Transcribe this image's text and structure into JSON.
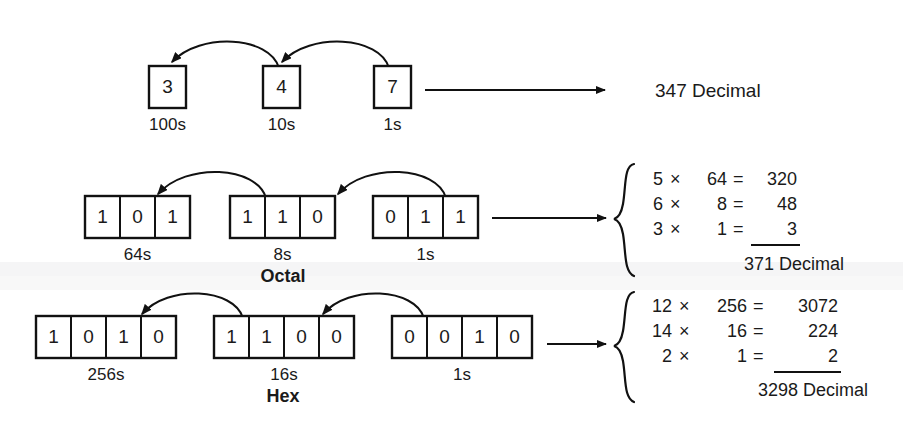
{
  "figure": {
    "background_color": "#ffffff",
    "ink_color": "#111111"
  },
  "rows": [
    {
      "id": "decimal",
      "base_label": "",
      "groups": [
        {
          "digits": [
            "3"
          ],
          "place_label": "100s"
        },
        {
          "digits": [
            "4"
          ],
          "place_label": "10s"
        },
        {
          "digits": [
            "7"
          ],
          "place_label": "1s"
        }
      ],
      "result": "347 Decimal"
    },
    {
      "id": "octal",
      "base_label": "Octal",
      "groups": [
        {
          "digits": [
            "1",
            "0",
            "1"
          ],
          "place_label": "64s"
        },
        {
          "digits": [
            "1",
            "1",
            "0"
          ],
          "place_label": "8s"
        },
        {
          "digits": [
            "0",
            "1",
            "1"
          ],
          "place_label": "1s"
        }
      ],
      "calc": {
        "lines": [
          {
            "digit": "5",
            "times": "×",
            "weight": "64",
            "equals": "=",
            "product": "320"
          },
          {
            "digit": "6",
            "times": "×",
            "weight": "8",
            "equals": "=",
            "product": "48"
          },
          {
            "digit": "3",
            "times": "×",
            "weight": "1",
            "equals": "=",
            "product": "3"
          }
        ],
        "total": "371 Decimal"
      }
    },
    {
      "id": "hex",
      "base_label": "Hex",
      "groups": [
        {
          "digits": [
            "1",
            "0",
            "1",
            "0"
          ],
          "place_label": "256s"
        },
        {
          "digits": [
            "1",
            "1",
            "0",
            "0"
          ],
          "place_label": "16s"
        },
        {
          "digits": [
            "0",
            "0",
            "1",
            "0"
          ],
          "place_label": "1s"
        }
      ],
      "calc": {
        "lines": [
          {
            "digit": "12",
            "times": "×",
            "weight": "256",
            "equals": "=",
            "product": "3072"
          },
          {
            "digit": "14",
            "times": "×",
            "weight": "16",
            "equals": "=",
            "product": "224"
          },
          {
            "digit": "2",
            "times": "×",
            "weight": "1",
            "equals": "=",
            "product": "2"
          }
        ],
        "total": "3298 Decimal"
      }
    }
  ],
  "icons": {
    "curved_arrow": "curved-arrow-icon",
    "straight_arrow": "straight-arrow-icon",
    "brace": "curly-brace-icon"
  }
}
